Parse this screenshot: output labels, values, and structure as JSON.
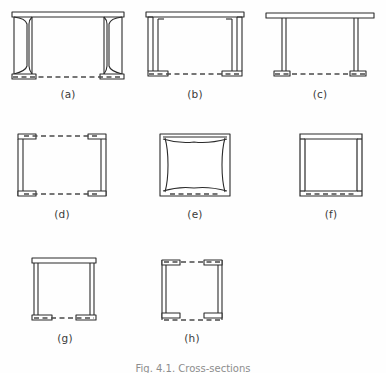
{
  "figure": {
    "background_color": "#fefefe",
    "ink_color": "#2b2b2b",
    "hidden_line_color": "#4a4a4a",
    "caption": "Fig. 4.1.  Cross-sections",
    "panels": [
      {
        "id": "a",
        "label": "(a)",
        "shape": "double-i-beam-tapered-flange",
        "description": "Pair of tapered-flange I sections with top cover plate and dashed hidden line at bottom",
        "x": 8,
        "y": 8,
        "w": 120,
        "h": 78
      },
      {
        "id": "b",
        "label": "(b)",
        "shape": "double-channel-with-top-plate",
        "description": "Two channel sections back to back under a top plate, dashed hidden line at bottom",
        "x": 140,
        "y": 8,
        "w": 110,
        "h": 78
      },
      {
        "id": "c",
        "label": "(c)",
        "shape": "thin-web-pair-with-top-plate",
        "description": "Two thin webs with small bottom flanges and a full-width top plate, dashed hidden line at bottom",
        "x": 262,
        "y": 8,
        "w": 116,
        "h": 78
      },
      {
        "id": "d",
        "label": "(d)",
        "shape": "double-channel-open-top",
        "description": "Two facing channel sections with dashed hidden lines at top and bottom",
        "x": 12,
        "y": 128,
        "w": 100,
        "h": 78
      },
      {
        "id": "e",
        "label": "(e)",
        "shape": "rounded-box-section",
        "description": "Closed box section with curved inner corners, dashed hidden line at bottom",
        "x": 152,
        "y": 128,
        "w": 86,
        "h": 78
      },
      {
        "id": "f",
        "label": "(f)",
        "shape": "square-box-section",
        "description": "Closed square box section with angular double-line outline, dashed hidden line at bottom",
        "x": 292,
        "y": 128,
        "w": 78,
        "h": 78
      },
      {
        "id": "g",
        "label": "(g)",
        "shape": "box-with-top-plate",
        "description": "Box section with full top plate and short inward bottom flanges, dashed hidden line at bottom",
        "x": 26,
        "y": 252,
        "w": 78,
        "h": 78
      },
      {
        "id": "h",
        "label": "(h)",
        "shape": "box-with-four-corner-flanges",
        "description": "Box section with inward flanges at all four corners, dashed hidden lines at top and bottom",
        "x": 156,
        "y": 252,
        "w": 72,
        "h": 78
      }
    ],
    "labels_row1_y": 88,
    "labels_row2_y": 212,
    "labels_row3_y": 336
  }
}
